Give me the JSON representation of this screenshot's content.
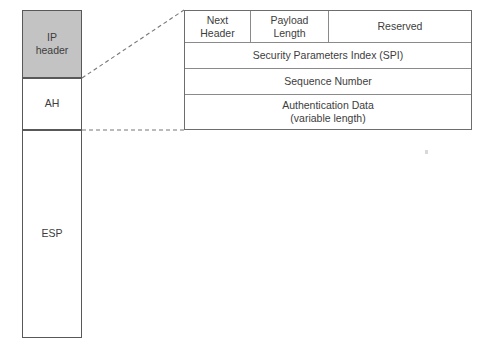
{
  "diagram": {
    "colors": {
      "ip_header_fill": "#c3c3c3",
      "box_stroke": "#585858",
      "table_stroke": "#6d6d6d",
      "inner_rule": "#8a8a8a",
      "text": "#3d3d3d",
      "page_background": "#ffffff"
    },
    "packet_stack": {
      "name": "packet-layout-column",
      "segments": [
        {
          "id": "ip-header",
          "label": "IP\nheader",
          "label_line1": "IP",
          "label_line2": "header",
          "filled": true
        },
        {
          "id": "ah",
          "label": "AH",
          "filled": false
        },
        {
          "id": "esp",
          "label": "ESP",
          "filled": false
        }
      ]
    },
    "ah_header_detail": {
      "name": "authentication-header-format",
      "expanded_from": "AH",
      "rows": [
        {
          "id": "fields-row",
          "cells": [
            {
              "id": "next-header",
              "line1": "Next",
              "line2": "Header"
            },
            {
              "id": "payload-length",
              "line1": "Payload",
              "line2": "Length"
            },
            {
              "id": "reserved",
              "line1": "Reserved",
              "line2": ""
            }
          ]
        },
        {
          "id": "spi-row",
          "cells": [
            {
              "id": "security-parameters-index",
              "line1": "Security Parameters Index (SPI)",
              "line2": ""
            }
          ]
        },
        {
          "id": "sequence-number-row",
          "cells": [
            {
              "id": "sequence-number",
              "line1": "Sequence Number",
              "line2": ""
            }
          ]
        },
        {
          "id": "authentication-data-row",
          "cells": [
            {
              "id": "authentication-data",
              "line1": "Authentication Data",
              "line2": "(variable length)"
            }
          ]
        }
      ]
    },
    "leader_lines": [
      {
        "id": "diagonal-leader",
        "from": "ip-header-bottom-right",
        "to": "detail-table-top-left",
        "style": "dashed"
      },
      {
        "id": "horizontal-leader",
        "from": "ah-bottom-right",
        "to": "detail-table-bottom-left",
        "style": "dashed"
      }
    ]
  }
}
